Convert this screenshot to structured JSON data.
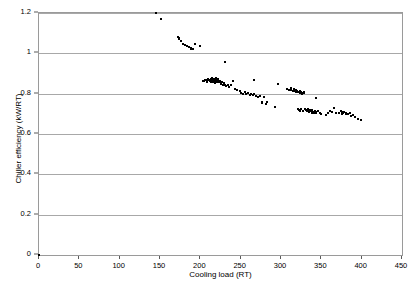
{
  "chart_data": {
    "type": "scatter",
    "title": "",
    "xlabel": "Cooling load (RT)",
    "ylabel": "Chiller efficiency (kW/RT)",
    "xlim": [
      0,
      450
    ],
    "ylim": [
      0,
      1.2
    ],
    "xticks": [
      0,
      50,
      100,
      150,
      200,
      250,
      300,
      350,
      400,
      450
    ],
    "xtick_labels": [
      "0",
      "50",
      "100",
      "150",
      "200",
      "250",
      "300",
      "350",
      "400",
      "450"
    ],
    "yticks": [
      0,
      0.2,
      0.4,
      0.6,
      0.8,
      1.0,
      1.2
    ],
    "ytick_labels": [
      "0",
      "0.2",
      "0.4",
      "0.6",
      "0.8",
      "1",
      "1.2"
    ],
    "grid": "horizontal",
    "legend": "none",
    "marker": "square",
    "marker_color": "#000000",
    "gridline_color": "#a8a8a8",
    "series": [
      {
        "name": "Chiller efficiency vs cooling load",
        "points": [
          [
            0,
            0
          ],
          [
            145,
            1.2
          ],
          [
            151,
            1.171
          ],
          [
            172,
            1.083
          ],
          [
            173,
            1.077
          ],
          [
            174,
            1.07
          ],
          [
            176,
            1.062
          ],
          [
            179,
            1.044
          ],
          [
            181,
            1.04
          ],
          [
            183,
            1.037
          ],
          [
            186,
            1.033
          ],
          [
            188,
            1.026
          ],
          [
            189,
            1.022
          ],
          [
            191,
            1.022
          ],
          [
            193,
            1.047
          ],
          [
            200,
            1.036
          ],
          [
            203,
            0.863
          ],
          [
            205,
            0.861
          ],
          [
            206,
            0.87
          ],
          [
            207,
            0.866
          ],
          [
            208,
            0.858
          ],
          [
            209,
            0.867
          ],
          [
            210,
            0.873
          ],
          [
            211,
            0.869
          ],
          [
            212,
            0.864
          ],
          [
            213,
            0.858
          ],
          [
            213,
            0.871
          ],
          [
            214,
            0.866
          ],
          [
            215,
            0.861
          ],
          [
            215,
            0.876
          ],
          [
            216,
            0.868
          ],
          [
            216,
            0.858
          ],
          [
            217,
            0.872
          ],
          [
            217,
            0.862
          ],
          [
            218,
            0.867
          ],
          [
            218,
            0.855
          ],
          [
            219,
            0.87
          ],
          [
            219,
            0.86
          ],
          [
            220,
            0.866
          ],
          [
            220,
            0.877
          ],
          [
            221,
            0.859
          ],
          [
            222,
            0.864
          ],
          [
            222,
            0.873
          ],
          [
            223,
            0.857
          ],
          [
            224,
            0.862
          ],
          [
            225,
            0.855
          ],
          [
            226,
            0.848
          ],
          [
            227,
            0.86
          ],
          [
            228,
            0.845
          ],
          [
            229,
            0.852
          ],
          [
            230,
            0.843
          ],
          [
            231,
            0.956
          ],
          [
            232,
            0.838
          ],
          [
            234,
            0.844
          ],
          [
            236,
            0.833
          ],
          [
            238,
            0.841
          ],
          [
            240,
            0.865
          ],
          [
            243,
            0.825
          ],
          [
            246,
            0.818
          ],
          [
            249,
            0.812
          ],
          [
            251,
            0.805
          ],
          [
            253,
            0.8
          ],
          [
            255,
            0.806
          ],
          [
            257,
            0.797
          ],
          [
            259,
            0.802
          ],
          [
            261,
            0.795
          ],
          [
            263,
            0.8
          ],
          [
            265,
            0.793
          ],
          [
            266,
            0.867
          ],
          [
            267,
            0.797
          ],
          [
            269,
            0.789
          ],
          [
            272,
            0.784
          ],
          [
            274,
            0.79
          ],
          [
            276,
            0.76
          ],
          [
            277,
            0.755
          ],
          [
            279,
            0.781
          ],
          [
            281,
            0.75
          ],
          [
            283,
            0.758
          ],
          [
            292,
            0.735
          ],
          [
            296,
            0.846
          ],
          [
            308,
            0.822
          ],
          [
            310,
            0.818
          ],
          [
            312,
            0.826
          ],
          [
            313,
            0.82
          ],
          [
            315,
            0.815
          ],
          [
            316,
            0.823
          ],
          [
            317,
            0.812
          ],
          [
            318,
            0.819
          ],
          [
            319,
            0.809
          ],
          [
            320,
            0.815
          ],
          [
            321,
            0.722
          ],
          [
            321,
            0.81
          ],
          [
            322,
            0.806
          ],
          [
            322,
            0.718
          ],
          [
            323,
            0.812
          ],
          [
            323,
            0.714
          ],
          [
            324,
            0.804
          ],
          [
            325,
            0.808
          ],
          [
            325,
            0.726
          ],
          [
            326,
            0.8
          ],
          [
            327,
            0.805
          ],
          [
            327,
            0.716
          ],
          [
            328,
            0.81
          ],
          [
            329,
            0.802
          ],
          [
            330,
            0.726
          ],
          [
            331,
            0.719
          ],
          [
            332,
            0.712
          ],
          [
            333,
            0.723
          ],
          [
            334,
            0.715
          ],
          [
            335,
            0.709
          ],
          [
            336,
            0.72
          ],
          [
            337,
            0.713
          ],
          [
            338,
            0.706
          ],
          [
            339,
            0.718
          ],
          [
            340,
            0.711
          ],
          [
            341,
            0.704
          ],
          [
            342,
            0.716
          ],
          [
            343,
            0.709
          ],
          [
            343,
            0.777
          ],
          [
            344,
            0.702
          ],
          [
            346,
            0.713
          ],
          [
            348,
            0.706
          ],
          [
            350,
            0.7
          ],
          [
            356,
            0.695
          ],
          [
            358,
            0.705
          ],
          [
            361,
            0.716
          ],
          [
            363,
            0.71
          ],
          [
            366,
            0.727
          ],
          [
            368,
            0.703
          ],
          [
            372,
            0.706
          ],
          [
            374,
            0.712
          ],
          [
            375,
            0.7
          ],
          [
            376,
            0.708
          ],
          [
            377,
            0.702
          ],
          [
            378,
            0.71
          ],
          [
            380,
            0.697
          ],
          [
            381,
            0.704
          ],
          [
            383,
            0.699
          ],
          [
            385,
            0.706
          ],
          [
            387,
            0.69
          ],
          [
            389,
            0.695
          ],
          [
            392,
            0.683
          ],
          [
            396,
            0.676
          ],
          [
            399,
            0.67
          ]
        ]
      }
    ]
  },
  "bottom_caption": ""
}
